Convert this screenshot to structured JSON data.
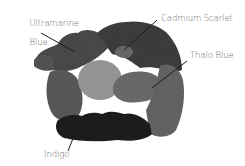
{
  "image": {
    "description": "Grayscale photo of watercolor paint swatches arranged in a ring",
    "background": "#ffffff"
  },
  "labels": [
    {
      "id": "ultramarine-blue",
      "text": "Ultramarine\nBlue",
      "line1": "Ultramarine",
      "line2": "Blue"
    },
    {
      "id": "cadmium-scarlet",
      "text": "Cadmium Scarlet"
    },
    {
      "id": "thalo-blue",
      "text": "Thalo Blue"
    },
    {
      "id": "indigo",
      "text": "Indigo"
    }
  ],
  "swatches": [
    {
      "name": "Ultramarine Blue",
      "tone": "#4a4a4a"
    },
    {
      "name": "Cadmium Scarlet",
      "tone": "#8c8c8c"
    },
    {
      "name": "Thalo Blue",
      "tone": "#5a5a5a"
    },
    {
      "name": "Indigo",
      "tone": "#1c1c1c"
    }
  ]
}
